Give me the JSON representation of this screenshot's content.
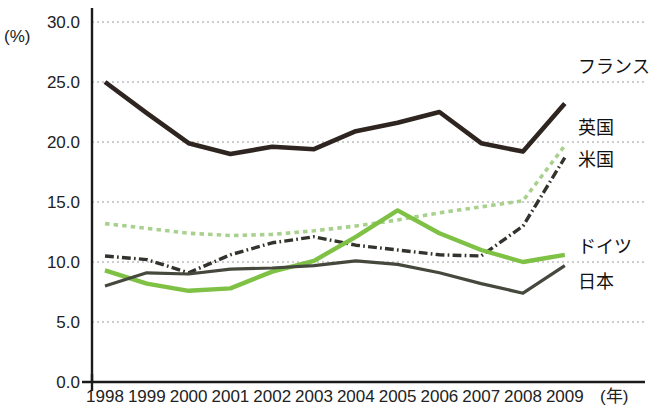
{
  "chart_data": {
    "type": "line",
    "title": "",
    "xlabel": "(年)",
    "ylabel": "(%)",
    "unit_label": "(%)",
    "x_unit_label": "(年)",
    "grid": true,
    "legend_position": "right-inline",
    "categories": [
      "1998",
      "1999",
      "2000",
      "2001",
      "2002",
      "2003",
      "2004",
      "2005",
      "2006",
      "2007",
      "2008",
      "2009"
    ],
    "x": [
      1998,
      1999,
      2000,
      2001,
      2002,
      2003,
      2004,
      2005,
      2006,
      2007,
      2008,
      2009
    ],
    "xlim": [
      1998,
      2009
    ],
    "ylim": [
      0.0,
      30.0
    ],
    "ytick_labels": [
      "0.0",
      "5.0",
      "10.0",
      "15.0",
      "20.0",
      "25.0",
      "30.0"
    ],
    "yticks": [
      0.0,
      5.0,
      10.0,
      15.0,
      20.0,
      25.0,
      30.0
    ],
    "series": [
      {
        "name": "フランス",
        "color": "#2e2520",
        "style": "solid",
        "width": 4.6,
        "values": [
          25.0,
          22.4,
          19.9,
          19.0,
          19.6,
          19.4,
          20.9,
          21.6,
          22.5,
          19.9,
          19.2,
          23.2
        ]
      },
      {
        "name": "英国",
        "color": "#a9d18e",
        "style": "dotted",
        "width": 3.6,
        "values": [
          13.2,
          12.8,
          12.4,
          12.2,
          12.3,
          12.6,
          13.0,
          13.5,
          14.1,
          14.6,
          15.1,
          19.7
        ]
      },
      {
        "name": "米国",
        "color": "#33332e",
        "style": "dashdot",
        "width": 3.4,
        "values": [
          10.5,
          10.2,
          9.1,
          10.6,
          11.6,
          12.1,
          11.4,
          11.0,
          10.6,
          10.5,
          13.0,
          18.7
        ]
      },
      {
        "name": "ドイツ",
        "color": "#7ec145",
        "style": "solid",
        "width": 4.4,
        "values": [
          9.3,
          8.2,
          7.6,
          7.8,
          9.2,
          10.1,
          12.1,
          14.3,
          12.4,
          11.0,
          10.0,
          10.6
        ]
      },
      {
        "name": "日本",
        "color": "#45483d",
        "style": "solid",
        "width": 3.2,
        "values": [
          8.0,
          9.1,
          9.0,
          9.4,
          9.5,
          9.7,
          10.1,
          9.8,
          9.1,
          8.2,
          7.4,
          9.7
        ]
      }
    ],
    "legend_entries": [
      {
        "label": "フランス",
        "color": "#2e2520",
        "value_year": 2009,
        "y_px": 73
      },
      {
        "label": "英国",
        "color": "#a9d18e",
        "value_year": 2009,
        "y_px": 134
      },
      {
        "label": "米国",
        "color": "#33332e",
        "value_year": 2009,
        "y_px": 166
      },
      {
        "label": "ドイツ",
        "color": "#7ec145",
        "value_year": 2009,
        "y_px": 253
      },
      {
        "label": "日本",
        "color": "#45483d",
        "value_year": 2009,
        "y_px": 288
      }
    ]
  }
}
